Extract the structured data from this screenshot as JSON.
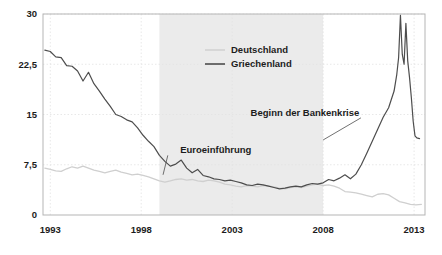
{
  "chart_data": {
    "type": "line",
    "title": "",
    "xlabel": "",
    "ylabel": "",
    "xlim": [
      1992.6,
      2013.6
    ],
    "ylim": [
      0,
      30
    ],
    "grid": true,
    "legend_position": "top-right",
    "y_ticks": [
      "0",
      "7,5",
      "15",
      "22,5",
      "30"
    ],
    "y_tick_values": [
      0,
      7.5,
      15,
      22.5,
      30
    ],
    "x_ticks": [
      "1993",
      "1998",
      "2003",
      "2008",
      "2013"
    ],
    "x_tick_values": [
      1993,
      1998,
      2003,
      2008,
      2013
    ],
    "series": [
      {
        "name": "Deutschland",
        "color": "#cfcfcf",
        "x": [
          1992.7,
          1993.0,
          1993.3,
          1993.6,
          1993.9,
          1994.2,
          1994.5,
          1994.8,
          1995.1,
          1995.4,
          1995.7,
          1996.0,
          1996.3,
          1996.6,
          1996.9,
          1997.2,
          1997.5,
          1997.8,
          1998.1,
          1998.4,
          1998.7,
          1999.0,
          1999.3,
          1999.6,
          1999.9,
          2000.2,
          2000.5,
          2000.8,
          2001.1,
          2001.4,
          2001.7,
          2002.0,
          2002.3,
          2002.6,
          2002.9,
          2003.2,
          2003.5,
          2003.8,
          2004.1,
          2004.4,
          2004.7,
          2005.0,
          2005.3,
          2005.6,
          2005.9,
          2006.2,
          2006.5,
          2006.8,
          2007.1,
          2007.4,
          2007.7,
          2008.0,
          2008.3,
          2008.6,
          2008.9,
          2009.2,
          2009.5,
          2009.8,
          2010.1,
          2010.4,
          2010.7,
          2011.0,
          2011.3,
          2011.6,
          2011.9,
          2012.2,
          2012.5,
          2012.8,
          2013.1,
          2013.4
        ],
        "values": [
          7.0,
          6.8,
          6.6,
          6.5,
          6.9,
          7.2,
          7.0,
          7.3,
          7.0,
          6.7,
          6.5,
          6.3,
          6.5,
          6.7,
          6.4,
          6.2,
          6.0,
          6.1,
          5.9,
          5.7,
          5.4,
          5.1,
          4.9,
          5.1,
          5.3,
          5.4,
          5.2,
          5.3,
          5.1,
          5.0,
          5.2,
          5.1,
          4.9,
          4.6,
          4.5,
          4.3,
          4.2,
          4.4,
          4.3,
          4.2,
          4.4,
          4.3,
          4.2,
          4.0,
          3.9,
          4.1,
          4.2,
          4.1,
          4.3,
          4.5,
          4.6,
          4.4,
          4.5,
          4.3,
          4.0,
          3.5,
          3.4,
          3.3,
          3.1,
          2.9,
          2.7,
          3.1,
          3.2,
          3.0,
          2.5,
          2.0,
          1.8,
          1.6,
          1.5,
          1.6
        ]
      },
      {
        "name": "Griechenland",
        "color": "#4d4d4d",
        "x": [
          1992.7,
          1993.0,
          1993.3,
          1993.6,
          1993.9,
          1994.2,
          1994.5,
          1994.8,
          1995.1,
          1995.4,
          1995.7,
          1996.0,
          1996.3,
          1996.6,
          1996.9,
          1997.2,
          1997.5,
          1997.8,
          1998.1,
          1998.4,
          1998.7,
          1999.0,
          1999.3,
          1999.6,
          1999.9,
          2000.2,
          2000.5,
          2000.8,
          2001.1,
          2001.4,
          2001.7,
          2002.0,
          2002.3,
          2002.6,
          2002.9,
          2003.2,
          2003.5,
          2003.8,
          2004.1,
          2004.4,
          2004.7,
          2005.0,
          2005.3,
          2005.6,
          2005.9,
          2006.2,
          2006.5,
          2006.8,
          2007.1,
          2007.4,
          2007.7,
          2008.0,
          2008.3,
          2008.6,
          2008.9,
          2009.2,
          2009.5,
          2009.8,
          2010.1,
          2010.4,
          2010.7,
          2011.0,
          2011.3,
          2011.6,
          2011.9,
          2012.05,
          2012.15,
          2012.25,
          2012.35,
          2012.45,
          2012.55,
          2012.65,
          2012.75,
          2012.85,
          2012.95,
          2013.05,
          2013.15,
          2013.3
        ],
        "values": [
          24.6,
          24.4,
          23.6,
          23.5,
          22.3,
          22.2,
          21.5,
          20.0,
          21.3,
          19.6,
          18.5,
          17.3,
          16.2,
          15.0,
          14.7,
          14.2,
          13.9,
          13.0,
          11.9,
          11.0,
          10.2,
          8.9,
          8.0,
          7.3,
          7.6,
          8.2,
          7.0,
          6.3,
          6.8,
          5.9,
          5.7,
          5.4,
          5.3,
          5.1,
          5.2,
          5.0,
          4.8,
          4.5,
          4.4,
          4.6,
          4.5,
          4.3,
          4.1,
          3.9,
          4.0,
          4.2,
          4.3,
          4.2,
          4.5,
          4.7,
          4.6,
          4.8,
          5.3,
          5.1,
          5.5,
          6.0,
          5.4,
          6.1,
          7.5,
          9.2,
          11.0,
          12.8,
          14.6,
          16.0,
          18.5,
          21.0,
          23.5,
          29.8,
          24.0,
          22.5,
          28.6,
          23.0,
          20.5,
          17.5,
          14.0,
          11.8,
          11.5,
          11.4
        ]
      }
    ],
    "shaded_region": {
      "from": 1999.0,
      "to": 2008.0,
      "color": "#ebebeb"
    },
    "annotations": [
      {
        "label": "Beginn der Bankenkrise",
        "x": 2007.0,
        "y": 14.8,
        "points_to_x": 2008.0,
        "points_to_y": 11.2
      },
      {
        "label": "Euroeinführung",
        "x": 2002.1,
        "y": 9.2,
        "points_to_x": 1999.2,
        "points_to_y": 6.0
      }
    ]
  },
  "legend": {
    "items": [
      {
        "label": "Deutschland",
        "color": "#cfcfcf"
      },
      {
        "label": "Griechenland",
        "color": "#4d4d4d"
      }
    ]
  },
  "axes": {
    "frame_color": "#b5b5b5",
    "grid_color": "#e2e2e2"
  }
}
